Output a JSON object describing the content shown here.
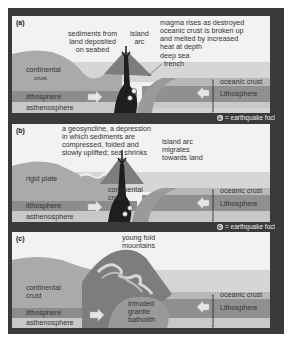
{
  "figure": {
    "legend": {
      "symbol": "⊕",
      "text": "= earthquake foci"
    },
    "colors": {
      "frame": "#3a3a3a",
      "sky": "#f2f2f2",
      "continental_crust": "#a9a9a9",
      "oceanic_crust": "#b5b5b5",
      "lithosphere": "#8f8f8f",
      "asthenosphere": "#c9c9c9",
      "sea": "#d6d6d6",
      "magma": "#1e1e1e",
      "arrow": "#e6e6e6"
    },
    "panels": [
      {
        "id": "a",
        "label": "(a)",
        "annotations": {
          "sediments": [
            "sediments from",
            "land deposited",
            "on seabed"
          ],
          "island_arc": [
            "island",
            "arc"
          ],
          "magma": [
            "magma rises as destroyed",
            "oceanic crust is broken up",
            "and melted by increased",
            "heat at depth"
          ],
          "trench": [
            "deep sea",
            "trench"
          ],
          "continental_crust": [
            "continental",
            "crust"
          ],
          "lithosphere_left": "lithosphere",
          "asthenosphere": "asthenosphere",
          "oceanic_crust": "oceanic crust",
          "lithosphere_right": "Lithosphere"
        }
      },
      {
        "id": "b",
        "label": "(b)",
        "annotations": {
          "geosyncline": [
            "a geosyncline, a depression",
            "in which sediments are",
            "compressed, folded and",
            "slowly uplifted; sea shrinks"
          ],
          "island_arc": [
            "island arc",
            "migrates",
            "towards land"
          ],
          "rigid_plate": "rigid plate",
          "continental_crust": [
            "continental",
            "crust"
          ],
          "lithosphere_left": "lithosphere",
          "asthenosphere": "asthenosphere",
          "oceanic_crust": "oceanic crust",
          "lithosphere_right": "Lithosphere"
        }
      },
      {
        "id": "c",
        "label": "(c)",
        "annotations": {
          "mountains": [
            "young fold",
            "mountains"
          ],
          "continental_crust": [
            "continental",
            "crust"
          ],
          "batholith": [
            "intruded",
            "granite",
            "batholith"
          ],
          "lithosphere_left": "lithosphere",
          "asthenosphere": "asthenosphere",
          "oceanic_crust": "oceanic crust",
          "lithosphere_right": "Lithosphere"
        }
      }
    ]
  }
}
